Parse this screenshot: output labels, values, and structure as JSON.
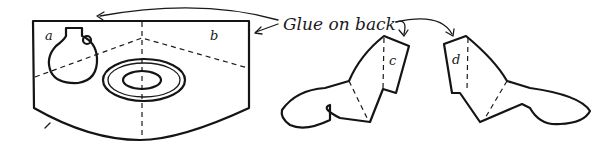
{
  "diagram": {
    "instruction_label": "Glue on back",
    "pieces": [
      {
        "id": "panel",
        "labels": [
          "a",
          "b"
        ],
        "description": "curved backdrop panel with jug and dish"
      },
      {
        "id": "left-wing",
        "labels": [
          "c"
        ]
      },
      {
        "id": "right-wing",
        "labels": [
          "d"
        ]
      }
    ],
    "colors": {
      "ink": "#141414",
      "paper": "#ffffff"
    }
  }
}
